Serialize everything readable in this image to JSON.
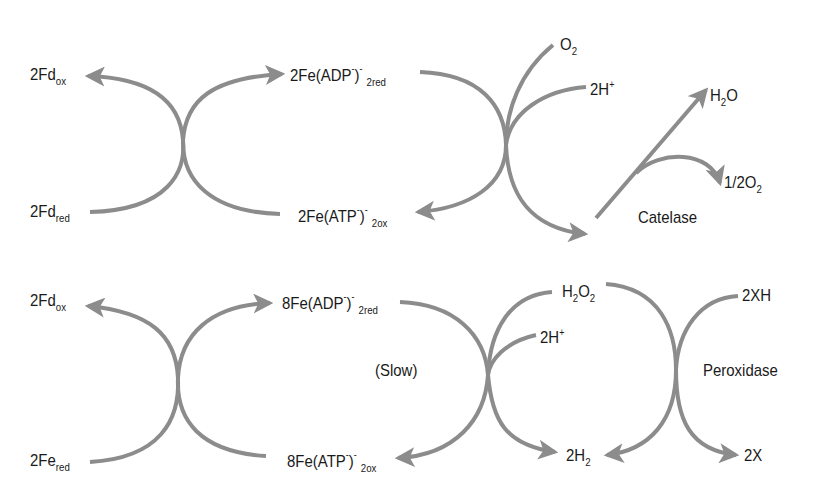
{
  "diagram": {
    "title": "",
    "colors": {
      "arrow": "#8c8c8c",
      "text": "#1a1a1a",
      "background": "#ffffff"
    },
    "top": {
      "fd_ox": {
        "base": "2Fd",
        "sub": "ox"
      },
      "fd_red": {
        "base": "2Fd",
        "sub": "red"
      },
      "fe_adp": {
        "base": "2Fe(ADP",
        "sup1": "-",
        "close": ")",
        "sup2": "-",
        "sub": "2red"
      },
      "fe_atp": {
        "base": "2Fe(ATP",
        "sup1": "-",
        "close": ")",
        "sup2": "-",
        "sub": "2ox"
      },
      "o2": {
        "base": "O",
        "sub": "2"
      },
      "h_plus": {
        "base": "2H",
        "sup": "+"
      },
      "h2o": {
        "base": "H",
        "sub": "2",
        "tail": "O"
      },
      "half_o2": {
        "base": "1/2O",
        "sub": "2"
      },
      "enzyme": "Catelase"
    },
    "bottom": {
      "fd_ox": {
        "base": "2Fd",
        "sub": "ox"
      },
      "fe_red": {
        "base": "2Fe",
        "sub": "red"
      },
      "fe_adp": {
        "base": "8Fe(ADP",
        "sup1": "-",
        "close": ")",
        "sup2": "-",
        "sub": "2red"
      },
      "fe_atp": {
        "base": "8Fe(ATP",
        "sup1": "-",
        "close": ")",
        "sup2": "-",
        "sub": "2ox"
      },
      "slow": "(Slow)",
      "h2o2": {
        "base": "H",
        "sub1": "2",
        "mid": "O",
        "sub2": "2"
      },
      "h_plus": {
        "base": "2H",
        "sup": "+"
      },
      "h2": {
        "base": "2H",
        "sub": "2"
      },
      "xh": "2XH",
      "x": "2X",
      "enzyme": "Peroxidase"
    }
  }
}
